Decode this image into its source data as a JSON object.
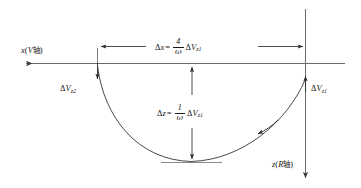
{
  "figure": {
    "kind": "physics-trajectory-diagram",
    "stroke_color": "#4d4d4d",
    "text_color": "#1a1a1a",
    "background": "#ffffff"
  },
  "axes": {
    "x_axis": {
      "label_main": "x",
      "label_paren_open": "(",
      "label_symbol": "V",
      "label_cjk": "轴",
      "label_paren_close": ")",
      "label_full": "x(V轴)",
      "direction": "left"
    },
    "z_axis": {
      "label_main": "z",
      "label_paren_open": "(",
      "label_symbol": "R",
      "label_cjk": "轴",
      "label_paren_close": ")",
      "label_full": "z(R轴)",
      "direction": "down"
    }
  },
  "annotations": {
    "delta_vz2": {
      "delta": "Δ",
      "symbol": "V",
      "subscript": "z2",
      "full": "ΔVz2"
    },
    "delta_vz1": {
      "delta": "Δ",
      "symbol": "V",
      "subscript": "z1",
      "full": "ΔVz1"
    }
  },
  "formulas": {
    "delta_x": {
      "delta": "Δ",
      "lhs": "x",
      "equals": "=",
      "numerator": "4",
      "denominator": "ω",
      "rhs_delta": "Δ",
      "rhs_symbol": "V",
      "rhs_subscript": "z1",
      "full": "Δx = (4/ω)ΔVz1"
    },
    "delta_z": {
      "delta": "Δ",
      "lhs": "z",
      "equals": "=",
      "numerator": "1",
      "denominator": "ω",
      "rhs_delta": "Δ",
      "rhs_symbol": "V",
      "rhs_subscript": "z1",
      "full": "Δz = (1/ω)ΔVz1"
    }
  }
}
